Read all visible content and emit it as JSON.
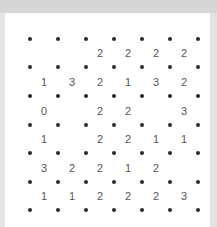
{
  "puzzle": {
    "type": "slitherlink",
    "rows": 6,
    "cols": 6,
    "clues": [
      [
        "",
        "",
        "2",
        "2",
        "2",
        "2"
      ],
      [
        "1",
        "3",
        "2",
        "1",
        "3",
        "2"
      ],
      [
        "0",
        "",
        "2",
        "2",
        "",
        "3"
      ],
      [
        "1",
        "",
        "2",
        "2",
        "1",
        "1"
      ],
      [
        "3",
        "2",
        "2",
        "1",
        "2",
        ""
      ],
      [
        "1",
        "1",
        "2",
        "2",
        "2",
        "3"
      ]
    ]
  },
  "colors": {
    "frame": "#d6d6d6",
    "board": "#ffffff",
    "dot": "#2a2a2a",
    "clue": "#555555"
  }
}
